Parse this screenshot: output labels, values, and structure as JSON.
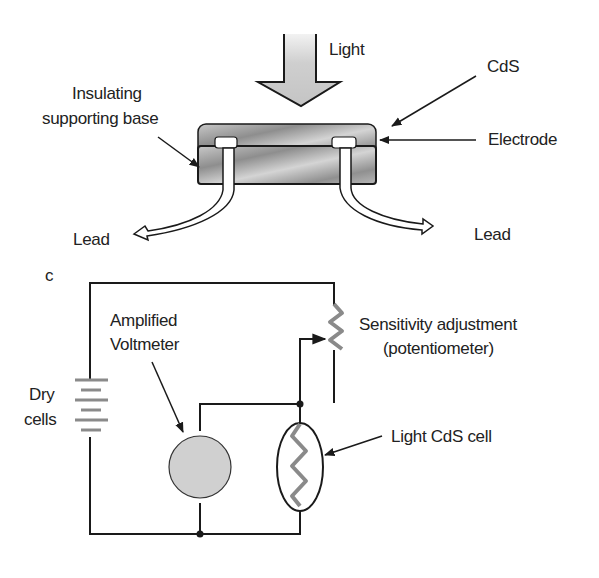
{
  "top_diagram": {
    "light_label": "Light",
    "cds_label": "CdS",
    "electrode_label": "Electrode",
    "base_label_line1": "Insulating",
    "base_label_line2": "supporting base",
    "lead_left_label": "Lead",
    "lead_right_label": "Lead"
  },
  "circuit": {
    "panel_letter": "c",
    "voltmeter_line1": "Amplified",
    "voltmeter_line2": "Voltmeter",
    "sensitivity_line1": "Sensitivity adjustment",
    "sensitivity_line2": "(potentiometer)",
    "drycells_line1": "Dry",
    "drycells_line2": "cells",
    "cds_cell_label": "Light  CdS cell"
  },
  "colors": {
    "arrow_fill": "#c9c9c9",
    "body_fill": "#a9a9a9",
    "voltmeter_fill": "#d0d0d0",
    "line": "#1a1a1a"
  }
}
